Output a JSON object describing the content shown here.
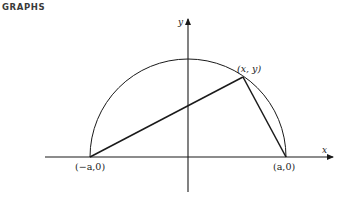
{
  "header": {
    "title": "GRAPHS"
  },
  "figure": {
    "axes": {
      "x_label": "x",
      "y_label": "y"
    },
    "points": {
      "left": "(−a,0)",
      "right": "(a,0)",
      "top": "(x, y)"
    },
    "colors": {
      "stroke": "#1a1a1a",
      "background": "#ffffff"
    }
  }
}
